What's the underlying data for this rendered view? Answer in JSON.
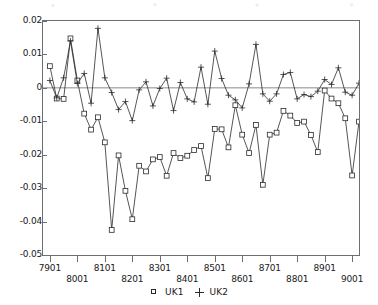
{
  "chart_data": {
    "type": "line",
    "title": "",
    "subtitle": "",
    "xlabel": "",
    "ylabel": "",
    "grid": false,
    "legend_position": "bottom-center",
    "xlim": [
      0,
      46
    ],
    "ylim": [
      -0.05,
      0.02
    ],
    "ytick_values": [
      0.02,
      0.01,
      0,
      -0.01,
      -0.02,
      -0.03,
      -0.04,
      -0.05
    ],
    "ytick_labels": [
      "0.02",
      "0.01",
      "0",
      "-0.01",
      "-0.02",
      "-0.03",
      "-0.04",
      "-0.05"
    ],
    "xtick_positions": [
      1,
      5,
      9,
      13,
      17,
      21,
      25,
      29,
      33,
      37,
      41,
      45
    ],
    "xtick_labels": [
      "7901",
      "8001",
      "8101",
      "8201",
      "8301",
      "8401",
      "8501",
      "8601",
      "8701",
      "8801",
      "8901",
      "9001"
    ],
    "zero_line": 0,
    "series": [
      {
        "name": "UK1",
        "marker": "square",
        "color": "#2b2b2b",
        "values": [
          0.0065,
          -0.0032,
          -0.0033,
          0.0148,
          0.0022,
          -0.0077,
          -0.0125,
          -0.0088,
          -0.0163,
          -0.0425,
          -0.0202,
          -0.0308,
          -0.0393,
          -0.0233,
          -0.025,
          -0.0214,
          -0.0207,
          -0.0263,
          -0.0195,
          -0.021,
          -0.0203,
          -0.0186,
          -0.0174,
          -0.027,
          -0.0123,
          -0.0124,
          -0.0178,
          -0.0052,
          -0.014,
          -0.0195,
          -0.0111,
          -0.029,
          -0.014,
          -0.0134,
          -0.0069,
          -0.0083,
          -0.0105,
          -0.0101,
          -0.0141,
          -0.0192,
          -0.0008,
          -0.0032,
          -0.0046,
          -0.0091,
          -0.0262,
          -0.0101
        ]
      },
      {
        "name": "UK2",
        "marker": "plus",
        "color": "#2b2b2b",
        "values": [
          0.0022,
          -0.003,
          0.003,
          0.014,
          0.0013,
          0.0043,
          -0.0046,
          0.0178,
          0.003,
          -0.0014,
          -0.0065,
          -0.0041,
          -0.0098,
          -0.0006,
          0.0018,
          -0.0054,
          -0.0002,
          0.0029,
          -0.0068,
          0.0016,
          -0.0033,
          -0.0042,
          0.0062,
          -0.0049,
          0.011,
          0.0028,
          -0.0022,
          -0.0036,
          -0.006,
          0.0012,
          0.013,
          -0.0018,
          -0.004,
          -0.0018,
          0.004,
          0.0046,
          -0.0033,
          -0.002,
          -0.0026,
          -0.001,
          0.0025,
          0.001,
          0.006,
          -0.0013,
          -0.0022,
          0.0014
        ]
      }
    ]
  },
  "legend": {
    "entries": [
      {
        "label": "UK1",
        "marker": "square"
      },
      {
        "label": "UK2",
        "marker": "plus"
      }
    ]
  }
}
